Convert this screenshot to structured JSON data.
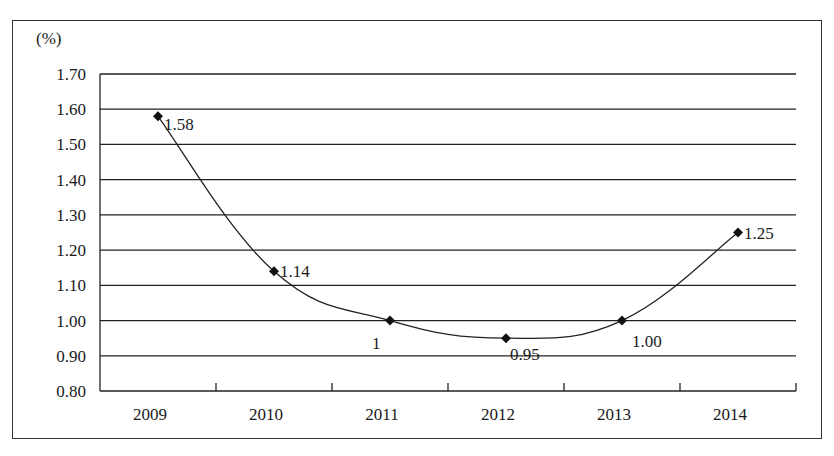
{
  "chart_data": {
    "type": "line",
    "title": "",
    "xlabel": "",
    "ylabel": "(%)",
    "categories": [
      "2009",
      "2010",
      "2011",
      "2012",
      "2013",
      "2014"
    ],
    "series": [
      {
        "name": "rate",
        "values": [
          1.58,
          1.14,
          1.0,
          0.95,
          1.0,
          1.25
        ]
      }
    ],
    "data_labels": [
      "1.58",
      "1.14",
      "1",
      "0.95",
      "1.00",
      "1.25"
    ],
    "yticks": [
      "1.70",
      "1.60",
      "1.50",
      "1.40",
      "1.30",
      "1.20",
      "1.10",
      "1.00",
      "0.90",
      "0.80"
    ],
    "ylim": [
      0.8,
      1.7
    ],
    "grid": true,
    "legend": "none",
    "marker": "diamond",
    "smooth": true
  }
}
